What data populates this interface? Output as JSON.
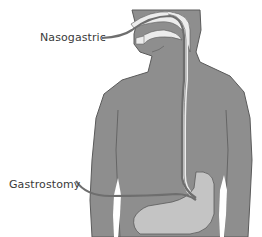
{
  "diagram": {
    "labels": {
      "nasogastric": "Nasogastric",
      "gastrostomy": "Gastrostomy"
    },
    "colors": {
      "background": "#ffffff",
      "body_fill": "#8e8e8e",
      "body_outline": "#5a5a5a",
      "stomach_fill": "#c4c4c4",
      "airway_fill": "#ececec",
      "tube_stroke": "#6e6e6e",
      "label_text": "#3a3a3a"
    }
  }
}
